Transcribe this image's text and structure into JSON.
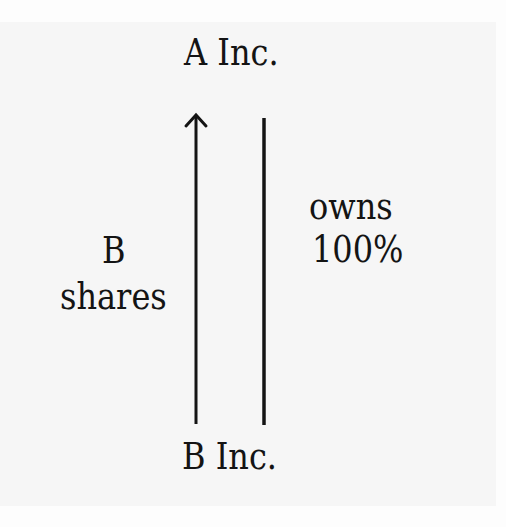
{
  "diagram": {
    "top_node": {
      "label": "A Inc."
    },
    "bottom_node": {
      "label": "B Inc."
    },
    "left_edge": {
      "label_line1": "B",
      "label_line2": "shares",
      "direction": "up",
      "from": "B Inc.",
      "to": "A Inc.",
      "has_arrowhead": true
    },
    "right_edge": {
      "label_line1": "owns",
      "label_line2": "100%",
      "has_arrowhead": false
    }
  },
  "colors": {
    "ink": "#141414",
    "paper": "#f6f6f6",
    "background": "#fdfdfd"
  }
}
